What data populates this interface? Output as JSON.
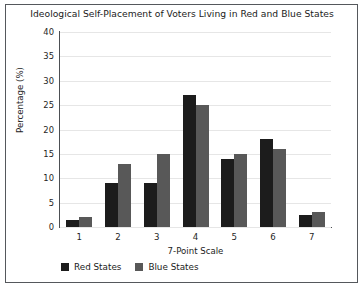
{
  "chart_data": {
    "type": "bar",
    "title": "Ideological Self-Placement of Voters Living in Red and Blue States",
    "xlabel": "7-Point Scale",
    "ylabel": "Percentage (%)",
    "categories": [
      "1",
      "2",
      "3",
      "4",
      "5",
      "6",
      "7"
    ],
    "series": [
      {
        "name": "Red States",
        "color": "#1c1c1c",
        "values": [
          1.5,
          9,
          9,
          27,
          14,
          18,
          2.5
        ]
      },
      {
        "name": "Blue States",
        "color": "#585858",
        "values": [
          2,
          13,
          15,
          25,
          15,
          16,
          3
        ]
      }
    ],
    "ylim": [
      0,
      40
    ],
    "yticks": [
      "0",
      "5",
      "10",
      "15",
      "20",
      "25",
      "30",
      "35",
      "40"
    ],
    "grid": true,
    "legend_position": "bottom-left"
  },
  "legend": {
    "items": [
      {
        "label": "Red States"
      },
      {
        "label": "Blue States"
      }
    ]
  }
}
